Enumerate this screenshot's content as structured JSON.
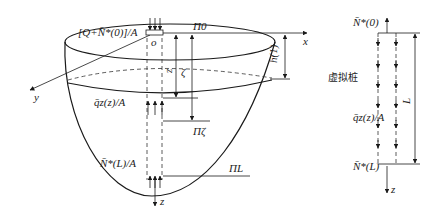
{
  "left_figure": {
    "top_load_label": "[Q+N̄*(0)]/A",
    "origin_label": "o",
    "plane_top_label": "Π0",
    "plane_zeta_label": "Πζ",
    "plane_L_label": "ΠL",
    "x_axis_label": "x",
    "y_axis_label": "y",
    "z_axis_label": "z",
    "dim_z_label": "z",
    "dim_zeta_label": "ζ",
    "dim_h_label": "h(1)",
    "side_load_label": "q̄z(z)/A",
    "bottom_load_label": "N̄*(L)/A"
  },
  "right_figure": {
    "top_force_label": "N̄*(0)",
    "virtual_pile_label": "虚拟桩",
    "side_load_label": "q̄z(z)/A",
    "length_label": "L",
    "bottom_force_label": "N̄*(L)",
    "z_axis_label": "z"
  }
}
